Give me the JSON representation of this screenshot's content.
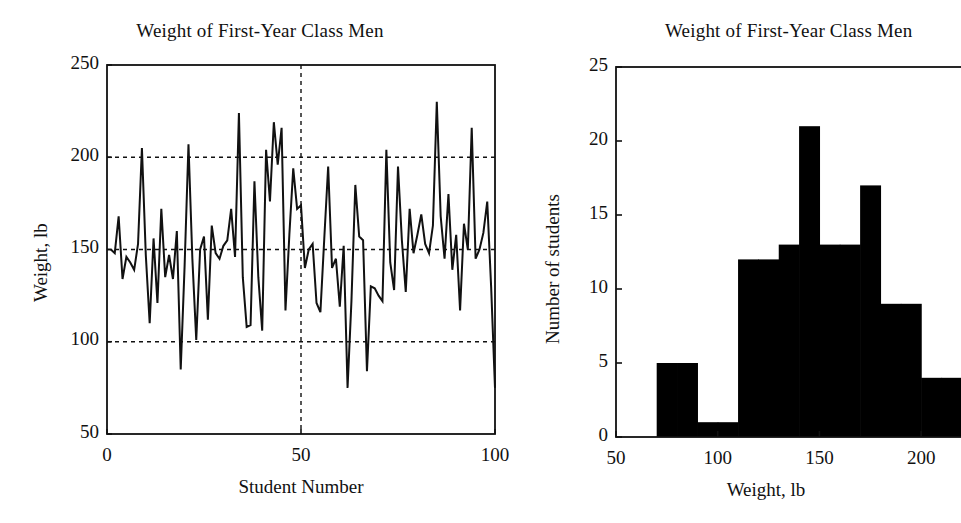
{
  "figure": {
    "background": "#ffffff",
    "ink": "#111111",
    "width": 957,
    "height": 523
  },
  "chart_data": [
    {
      "id": "line-panel",
      "type": "line",
      "title": "Weight of First-Year Class Men",
      "xlabel": "Student Number",
      "ylabel": "Weight, lb",
      "xlim": [
        0,
        100
      ],
      "ylim": [
        50,
        250
      ],
      "xticks": [
        0,
        50,
        100
      ],
      "xticklabels": [
        "0",
        "50",
        "100"
      ],
      "yticks": [
        50,
        100,
        150,
        200,
        250
      ],
      "yticklabels": [
        "50",
        "100",
        "150",
        "200",
        "250"
      ],
      "grid": "dashed gridlines at y=100,150,200 and x=50",
      "gridlines_y": [
        100,
        150,
        200
      ],
      "gridlines_x": [
        50
      ],
      "legend": "none",
      "line_color": "#111111",
      "x": [
        1,
        2,
        3,
        4,
        5,
        6,
        7,
        8,
        9,
        10,
        11,
        12,
        13,
        14,
        15,
        16,
        17,
        18,
        19,
        20,
        21,
        22,
        23,
        24,
        25,
        26,
        27,
        28,
        29,
        30,
        31,
        32,
        33,
        34,
        35,
        36,
        37,
        38,
        39,
        40,
        41,
        42,
        43,
        44,
        45,
        46,
        47,
        48,
        49,
        50,
        51,
        52,
        53,
        54,
        55,
        56,
        57,
        58,
        59,
        60,
        61,
        62,
        63,
        64,
        65,
        66,
        67,
        68,
        69,
        70,
        71,
        72,
        73,
        74,
        75,
        76,
        77,
        78,
        79,
        80,
        81,
        82,
        83,
        84,
        85,
        86,
        87,
        88,
        89,
        90,
        91,
        92,
        93,
        94,
        95,
        96,
        97,
        98,
        99,
        100
      ],
      "values": [
        150,
        148,
        168,
        134,
        146,
        143,
        139,
        153,
        205,
        147,
        110,
        156,
        121,
        172,
        135,
        147,
        134,
        160,
        85,
        141,
        207,
        145,
        101,
        150,
        157,
        112,
        163,
        148,
        145,
        152,
        155,
        172,
        146,
        224,
        135,
        108,
        109,
        187,
        135,
        106,
        204,
        176,
        219,
        196,
        216,
        117,
        158,
        194,
        172,
        174,
        140,
        150,
        153,
        121,
        116,
        156,
        195,
        140,
        145,
        119,
        152,
        75,
        122,
        185,
        157,
        155,
        84,
        130,
        129,
        125,
        122,
        204,
        143,
        128,
        195,
        155,
        127,
        172,
        148,
        158,
        169,
        153,
        148,
        163,
        230,
        168,
        145,
        180,
        139,
        158,
        117,
        164,
        150,
        216,
        145,
        150,
        159,
        176,
        130,
        75
      ]
    },
    {
      "id": "histogram-panel",
      "type": "bar",
      "title": "Weight of First-Year Class Men",
      "xlabel": "Weight, lb",
      "ylabel": "Number of students",
      "xlim": [
        50,
        225
      ],
      "ylim": [
        0,
        25
      ],
      "xticks": [
        50,
        100,
        150,
        200
      ],
      "xticklabels": [
        "50",
        "100",
        "150",
        "200"
      ],
      "yticks": [
        0,
        5,
        10,
        15,
        20,
        25
      ],
      "yticklabels": [
        "0",
        "5",
        "10",
        "15",
        "20",
        "25"
      ],
      "grid": "off",
      "legend": "none",
      "bar_color": "#000000",
      "bin_width": 10,
      "bin_starts": [
        70,
        80,
        90,
        100,
        110,
        120,
        130,
        140,
        150,
        160,
        170,
        180,
        190,
        200,
        210,
        220
      ],
      "categories": [
        "70-80",
        "80-90",
        "90-100",
        "100-110",
        "110-120",
        "120-130",
        "130-140",
        "140-150",
        "150-160",
        "160-170",
        "170-180",
        "180-190",
        "190-200",
        "200-210",
        "210-220",
        "220-230"
      ],
      "values": [
        5,
        5,
        1,
        1,
        12,
        12,
        13,
        21,
        13,
        13,
        17,
        9,
        9,
        4,
        4,
        5
      ],
      "note": "right edge of axes is cropped by the figure border"
    }
  ]
}
